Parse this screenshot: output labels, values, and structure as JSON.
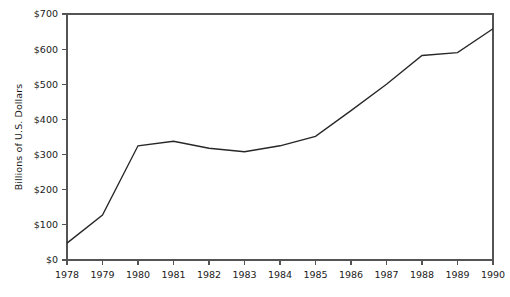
{
  "chart_data": {
    "type": "line",
    "title": "",
    "xlabel": "",
    "ylabel": "Billions of U.S. Dollars",
    "x": [
      1978,
      1979,
      1980,
      1981,
      1982,
      1983,
      1984,
      1985,
      1986,
      1987,
      1988,
      1989,
      1990
    ],
    "categories": [
      "1978",
      "1979",
      "1980",
      "1981",
      "1982",
      "1983",
      "1984",
      "1985",
      "1986",
      "1987",
      "1988",
      "1989",
      "1990"
    ],
    "values": [
      48,
      128,
      325,
      338,
      318,
      308,
      325,
      352,
      425,
      500,
      582,
      590,
      658
    ],
    "series": [
      {
        "name": "Billions of U.S. Dollars",
        "values": [
          48,
          128,
          325,
          338,
          318,
          308,
          325,
          352,
          425,
          500,
          582,
          590,
          658
        ]
      }
    ],
    "xlim": [
      1978,
      1990
    ],
    "ylim": [
      0,
      700
    ],
    "ytick_values": [
      0,
      100,
      200,
      300,
      400,
      500,
      600,
      700
    ],
    "ytick_labels": [
      "$0",
      "$100",
      "$200",
      "$300",
      "$400",
      "$500",
      "$600",
      "$700"
    ],
    "xtick_labels": [
      "1978",
      "1979",
      "1980",
      "1981",
      "1982",
      "1983",
      "1984",
      "1985",
      "1986",
      "1987",
      "1988",
      "1989",
      "1990"
    ],
    "grid": false,
    "legend": false,
    "legend_position": "none",
    "line_color": "#272727",
    "axis_color": "#545454",
    "background_color": "#ffffff",
    "annotations": []
  },
  "plot_geometry": {
    "left": 67,
    "right": 493,
    "top": 14,
    "bottom": 260
  }
}
